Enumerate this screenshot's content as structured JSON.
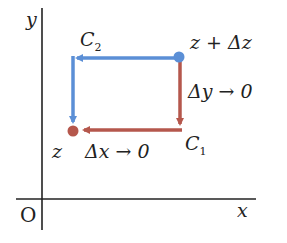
{
  "axes": {
    "x_label": "x",
    "y_label": "y",
    "origin_label": "O"
  },
  "points": {
    "start": {
      "label": "z",
      "color": "#b5574c"
    },
    "end": {
      "label": "z + Δz",
      "color": "#5b8fd6"
    }
  },
  "paths": {
    "c1": {
      "label": "C",
      "subscript": "1",
      "color": "#b5574c",
      "description": "right then up along horizontal then vertical"
    },
    "c2": {
      "label": "C",
      "subscript": "2",
      "color": "#5b8fd6",
      "description": "up then right along vertical then horizontal"
    }
  },
  "annotations": {
    "dx": "Δx → 0",
    "dy": "Δy → 0"
  }
}
